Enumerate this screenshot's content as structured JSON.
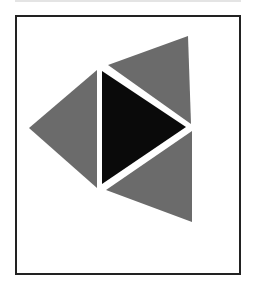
{
  "diagram": {
    "colors": {
      "frame": "#222222",
      "gray": "#6b6b6b",
      "black": "#0a0a0a",
      "background": "#ffffff"
    },
    "shapes": [
      {
        "name": "left-triangle",
        "fill": "gray",
        "points": "97,70 29,128 97,188"
      },
      {
        "name": "center-triangle",
        "fill": "black",
        "points": "102,71 186,127 102,184"
      },
      {
        "name": "top-triangle",
        "fill": "gray",
        "points": "108,65 188,36 191,124"
      },
      {
        "name": "bottom-triangle",
        "fill": "gray",
        "points": "192,131 192,222 106,190"
      }
    ]
  }
}
